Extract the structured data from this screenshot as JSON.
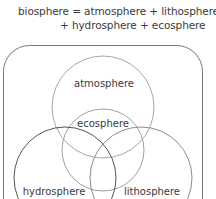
{
  "equation": {
    "line1": "biosphere = atmosphere + lithosphere",
    "line2": "+ hydrosphere + ecosphere"
  },
  "diagram": {
    "type": "venn",
    "container": "biosphere",
    "sets": [
      {
        "name": "atmosphere",
        "label": "atmosphere",
        "color": "#a8a8a8"
      },
      {
        "name": "ecosphere",
        "label": "ecosphere",
        "color": "#a8a8a8"
      },
      {
        "name": "hydrosphere",
        "label": "hydrosphere",
        "color": "#555555"
      },
      {
        "name": "lithosphere",
        "label": "lithosphere",
        "color": "#8c8c8c"
      }
    ],
    "border_color": "#777777"
  }
}
